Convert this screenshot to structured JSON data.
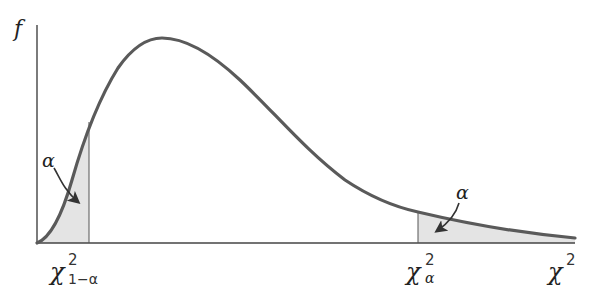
{
  "diagram": {
    "y_axis_label": "f",
    "x_axis_label": "χ",
    "x_axis_label_sup": "2",
    "left_critical": {
      "base": "χ",
      "sup": "2",
      "sub": "1−α"
    },
    "right_critical": {
      "base": "χ",
      "sup": "2",
      "sub": "α"
    },
    "left_tail_label": "α",
    "right_tail_label": "α",
    "colors": {
      "curve": "#5a5a5a",
      "axis": "#444444",
      "shade": "#e4e4e4",
      "arrow": "#333333"
    }
  }
}
